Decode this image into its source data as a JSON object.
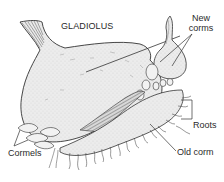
{
  "diagram": {
    "title": "GLADIOLUS",
    "labels": {
      "new_corms_line1": "New",
      "new_corms_line2": "corms",
      "roots": "Roots",
      "old_corm": "Old corm",
      "cormels": "Cormels"
    },
    "colors": {
      "ink": "#2a2a2a",
      "fill": "#e8e8e8",
      "background": "#ffffff"
    }
  }
}
